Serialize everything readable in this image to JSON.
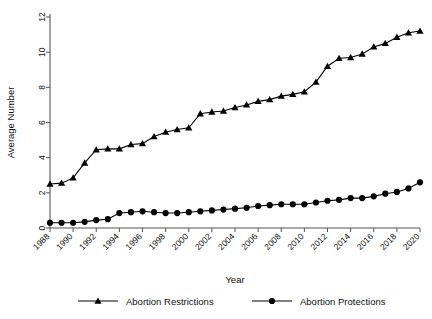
{
  "chart_data": {
    "type": "line",
    "title": "",
    "xlabel": "Year",
    "ylabel": "Average Number",
    "xlim": [
      1988,
      2020
    ],
    "ylim": [
      0,
      12
    ],
    "yticks": [
      0,
      2,
      4,
      6,
      8,
      10,
      12
    ],
    "xticks": [
      1988,
      1990,
      1992,
      1994,
      1996,
      1998,
      2000,
      2002,
      2004,
      2006,
      2008,
      2010,
      2012,
      2014,
      2016,
      2018,
      2020
    ],
    "grid": false,
    "legend_position": "bottom",
    "x": [
      1988,
      1989,
      1990,
      1991,
      1992,
      1993,
      1994,
      1995,
      1996,
      1997,
      1998,
      1999,
      2000,
      2001,
      2002,
      2003,
      2004,
      2005,
      2006,
      2007,
      2008,
      2009,
      2010,
      2011,
      2012,
      2013,
      2014,
      2015,
      2016,
      2017,
      2018,
      2019,
      2020
    ],
    "series": [
      {
        "name": "Abortion Restrictions",
        "marker": "triangle",
        "color": "#000000",
        "values": [
          2.5,
          2.55,
          2.85,
          3.7,
          4.45,
          4.5,
          4.5,
          4.75,
          4.8,
          5.2,
          5.45,
          5.6,
          5.7,
          6.5,
          6.6,
          6.65,
          6.85,
          7.0,
          7.2,
          7.3,
          7.5,
          7.6,
          7.75,
          8.3,
          9.2,
          9.65,
          9.7,
          9.9,
          10.3,
          10.5,
          10.85,
          11.1,
          11.2
        ]
      },
      {
        "name": "Abortion Protections",
        "marker": "circle",
        "color": "#000000",
        "values": [
          0.3,
          0.3,
          0.3,
          0.35,
          0.45,
          0.5,
          0.85,
          0.9,
          0.95,
          0.9,
          0.85,
          0.85,
          0.9,
          0.95,
          1.0,
          1.05,
          1.1,
          1.15,
          1.25,
          1.3,
          1.35,
          1.35,
          1.35,
          1.45,
          1.55,
          1.6,
          1.7,
          1.7,
          1.8,
          1.95,
          2.05,
          2.25,
          2.6
        ]
      }
    ]
  },
  "legend": {
    "items": [
      {
        "label": "Abortion Restrictions",
        "marker": "triangle-marker"
      },
      {
        "label": "Abortion Protections",
        "marker": "circle-marker"
      }
    ]
  }
}
